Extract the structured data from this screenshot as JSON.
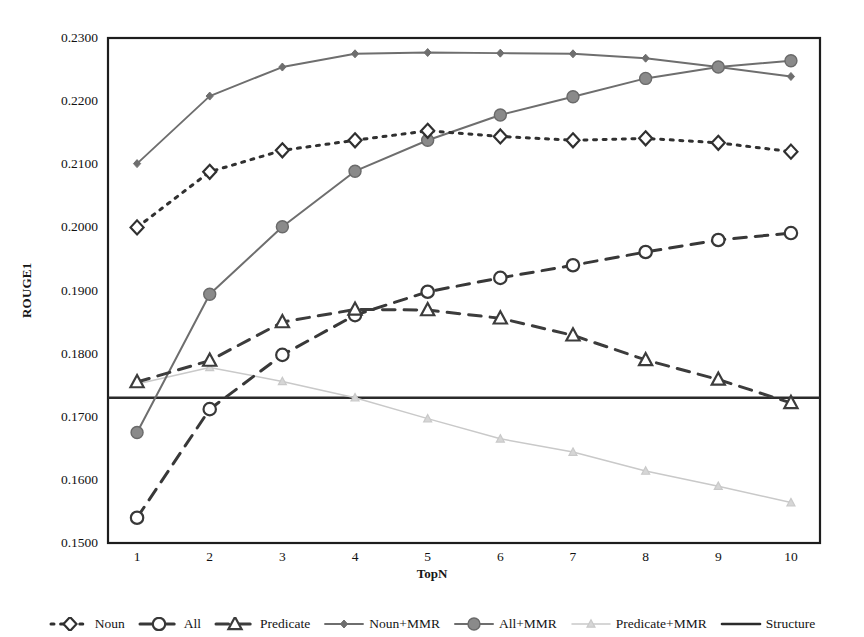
{
  "chart_data": {
    "type": "line",
    "title": "",
    "subtitle": "",
    "xlabel": "TopN",
    "ylabel": "ROUGE1",
    "x": [
      1,
      2,
      3,
      4,
      5,
      6,
      7,
      8,
      9,
      10
    ],
    "categories": [
      "1",
      "2",
      "3",
      "4",
      "5",
      "6",
      "7",
      "8",
      "9",
      "10"
    ],
    "xlim": [
      0.6,
      10.4
    ],
    "ylim": [
      0.15,
      0.23
    ],
    "ytick_labels": [
      "0.2300",
      "0.2200",
      "0.2100",
      "0.2000",
      "0.1900",
      "0.1800",
      "0.1700",
      "0.1600",
      "0.1500"
    ],
    "ytick_values": [
      0.23,
      0.22,
      0.21,
      0.2,
      0.19,
      0.18,
      0.17,
      0.16,
      0.15
    ],
    "grid": false,
    "legend_position": "bottom",
    "plot_border": true,
    "series": [
      {
        "name": "Noun",
        "marker": "open-diamond",
        "line_style": "dotted",
        "color": "#303030",
        "values": [
          0.2,
          0.2088,
          0.2122,
          0.2138,
          0.2153,
          0.2144,
          0.2138,
          0.2141,
          0.2134,
          0.212
        ]
      },
      {
        "name": "All",
        "marker": "open-circle",
        "line_style": "dashed",
        "color": "#383838",
        "values": [
          0.154,
          0.1712,
          0.1798,
          0.1861,
          0.1898,
          0.192,
          0.194,
          0.1961,
          0.198,
          0.1991
        ]
      },
      {
        "name": "Predicate",
        "marker": "open-triangle",
        "line_style": "dashed",
        "color": "#3c3c3c",
        "values": [
          0.1755,
          0.1789,
          0.185,
          0.187,
          0.1869,
          0.1856,
          0.1829,
          0.179,
          0.1759,
          0.1722
        ]
      },
      {
        "name": "Noun+MMR",
        "marker": "filled-small-diamond",
        "line_style": "solid",
        "color": "#6e6e6e",
        "values": [
          0.2101,
          0.2208,
          0.2254,
          0.2275,
          0.2277,
          0.2276,
          0.2275,
          0.2268,
          0.2254,
          0.2239
        ]
      },
      {
        "name": "All+MMR",
        "marker": "filled-circle",
        "line_style": "solid",
        "color": "#6e6e6e",
        "values": [
          0.1675,
          0.1894,
          0.2001,
          0.2089,
          0.2138,
          0.2178,
          0.2207,
          0.2236,
          0.2254,
          0.2264
        ]
      },
      {
        "name": "Predicate+MMR",
        "marker": "filled-small-triangle",
        "line_style": "solid",
        "color": "#c9c9c9",
        "values": [
          0.1752,
          0.1778,
          0.1756,
          0.173,
          0.1697,
          0.1665,
          0.1644,
          0.1614,
          0.159,
          0.1564
        ]
      },
      {
        "name": "Structure",
        "marker": "none",
        "line_style": "solid",
        "color": "#2b2b2b",
        "constant": 0.173,
        "values": [
          0.173,
          0.173,
          0.173,
          0.173,
          0.173,
          0.173,
          0.173,
          0.173,
          0.173,
          0.173
        ]
      }
    ]
  },
  "legend": {
    "items": [
      {
        "label": "Noun"
      },
      {
        "label": "All"
      },
      {
        "label": "Predicate"
      },
      {
        "label": "Noun+MMR"
      },
      {
        "label": "All+MMR"
      },
      {
        "label": "Predicate+MMR"
      },
      {
        "label": "Structure"
      }
    ]
  }
}
